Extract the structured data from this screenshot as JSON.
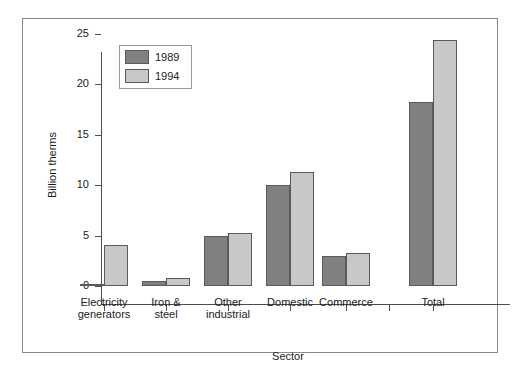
{
  "chart_data": {
    "type": "bar",
    "title": "",
    "xlabel": "Sector",
    "ylabel": "Billion therms",
    "ylim": [
      0,
      25
    ],
    "yticks": [
      0,
      5,
      10,
      15,
      20,
      25
    ],
    "ytick_labels": [
      "0",
      "5",
      "10",
      "15",
      "20",
      "25"
    ],
    "grid": false,
    "legend_position": "top-left",
    "categories": [
      "Electricity\ngenerators",
      "Iron &\nsteel",
      "Other\nindustrial",
      "Domestic",
      "Commerce",
      "Total"
    ],
    "series": [
      {
        "name": "1989",
        "color": "#808080",
        "values": [
          0.2,
          0.5,
          5.0,
          10.0,
          3.0,
          18.3
        ]
      },
      {
        "name": "1994",
        "color": "#c8c8c8",
        "values": [
          4.1,
          0.8,
          5.3,
          11.3,
          3.3,
          24.4
        ]
      }
    ]
  },
  "legend": {
    "entries": [
      {
        "label": "1989"
      },
      {
        "label": "1994"
      }
    ]
  },
  "colors": {
    "series_1989": "#808080",
    "series_1994": "#c8c8c8",
    "axis": "#4d4d4d",
    "frame": "#8a8a8a",
    "background": "#ffffff"
  }
}
